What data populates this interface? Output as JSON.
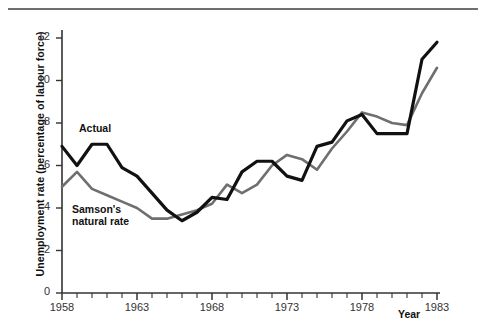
{
  "chart_data": {
    "type": "line",
    "title": "",
    "xlabel": "Year",
    "ylabel": "Unemployment rate (percentage of labour force)",
    "xlim": [
      1958,
      1983
    ],
    "ylim": [
      0,
      12.6
    ],
    "grid": false,
    "legend_position": "inline-annotation",
    "x_tick_labels": [
      "1958",
      "1963",
      "1968",
      "1973",
      "1978",
      "1983"
    ],
    "x_tick_values": [
      1958,
      1963,
      1968,
      1973,
      1978,
      1983
    ],
    "x_minor_tick_interval": 1,
    "y_tick_labels": [
      "0",
      "2",
      "4",
      "6",
      "8",
      "10",
      "12"
    ],
    "y_tick_values": [
      0,
      2,
      4,
      6,
      8,
      10,
      12
    ],
    "x": [
      1958,
      1959,
      1960,
      1961,
      1962,
      1963,
      1964,
      1965,
      1966,
      1967,
      1968,
      1969,
      1970,
      1971,
      1972,
      1973,
      1974,
      1975,
      1976,
      1977,
      1978,
      1979,
      1980,
      1981,
      1982,
      1983
    ],
    "series": [
      {
        "name": "Actual",
        "color": "#111111",
        "values": [
          6.9,
          6.0,
          7.0,
          7.0,
          5.9,
          5.5,
          4.7,
          3.9,
          3.4,
          3.8,
          4.5,
          4.4,
          5.7,
          6.2,
          6.2,
          5.5,
          5.3,
          6.9,
          7.1,
          8.1,
          8.4,
          7.5,
          7.5,
          7.5,
          11.0,
          11.8
        ]
      },
      {
        "name": "Samson's natural rate",
        "color": "#6f6f6f",
        "values": [
          5.0,
          5.7,
          4.9,
          4.6,
          4.3,
          4.0,
          3.5,
          3.5,
          3.7,
          3.9,
          4.2,
          5.1,
          4.7,
          5.1,
          6.0,
          6.5,
          6.3,
          5.8,
          6.8,
          7.6,
          8.5,
          8.3,
          8.0,
          7.9,
          9.4,
          10.6
        ]
      }
    ],
    "annotations": [
      {
        "text": "Actual",
        "series": "Actual"
      },
      {
        "text": "Samson's\nnatural rate",
        "series": "Samson's natural rate"
      }
    ]
  },
  "annotation_lines": {
    "actual": "Actual",
    "natural_line1": "Samson's",
    "natural_line2": "natural rate"
  }
}
